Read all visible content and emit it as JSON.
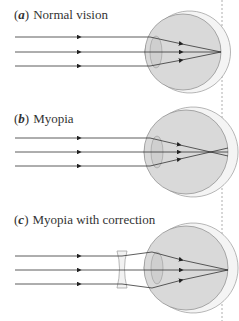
{
  "panels": [
    {
      "letter": "a",
      "open": "(",
      "close": ")",
      "title": "Normal vision",
      "condition": "normal"
    },
    {
      "letter": "b",
      "open": "(",
      "close": ")",
      "title": "Myopia",
      "condition": "myopia"
    },
    {
      "letter": "c",
      "open": "(",
      "close": ")",
      "title": "Myopia with correction",
      "condition": "myopia-corrected"
    }
  ],
  "colors": {
    "ray": "#333333",
    "eye_fill": "#d9d9d9",
    "eye_outline": "#888888",
    "lens_fill": "#cfcfcf",
    "retina_line": "#999999"
  }
}
